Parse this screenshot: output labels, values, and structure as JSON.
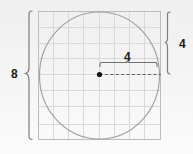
{
  "diagram": {
    "labels": {
      "square_side": "8",
      "circle_radius_vertical": "4",
      "circle_radius_horizontal": "4"
    },
    "colors": {
      "background": "#f2f2f2",
      "grid_line": "#d8d8d8",
      "square_border": "#b8b8b8",
      "circle_stroke": "#9a9a9a",
      "brace_stroke": "#7d7d7d",
      "dim_line": "#6a6a6a",
      "center_dot": "#111111",
      "label_text": "#1b1b1b"
    },
    "grid": {
      "columns": 8,
      "rows": 8
    },
    "icons": {
      "center_point": "center-dot-icon",
      "left_brace": "left-curly-brace-icon",
      "right_brace": "right-curly-brace-icon",
      "radius_brace": "top-curly-brace-icon",
      "radius_line": "dashed-radius-line-icon"
    }
  }
}
